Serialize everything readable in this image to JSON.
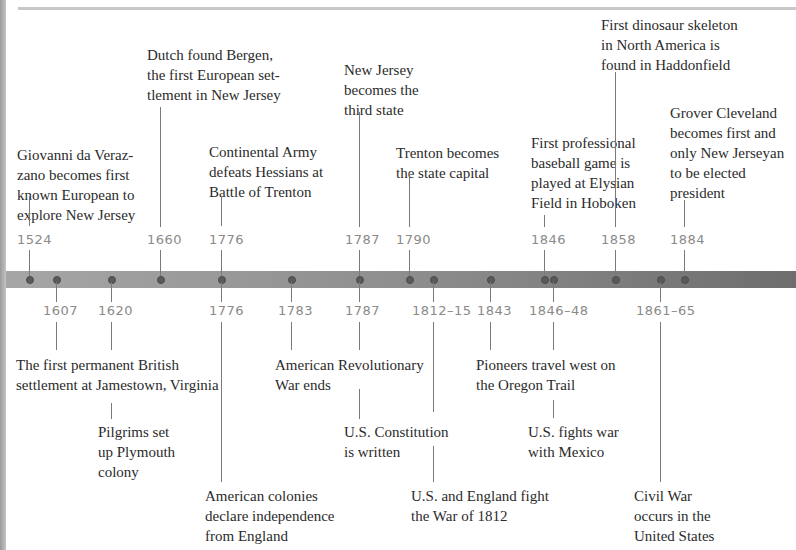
{
  "timeline": {
    "above_events": [
      {
        "year": "1524",
        "text": "Giovanni da Veraz-\nzano becomes first\nknown European to\nexplore New Jersey"
      },
      {
        "year": "1660",
        "text": "Dutch found Bergen,\nthe first European set-\ntlement in New Jersey"
      },
      {
        "year": "1776",
        "text": "Continental Army\ndefeats Hessians at\nBattle of Trenton"
      },
      {
        "year": "1787",
        "text": "New Jersey\nbecomes the\nthird state"
      },
      {
        "year": "1790",
        "text": "Trenton becomes\nthe state capital"
      },
      {
        "year": "1846",
        "text": "First professional\nbaseball game is\nplayed at Elysian\nField in Hoboken"
      },
      {
        "year": "1858",
        "text": "First dinosaur skeleton\nin North America is\nfound in Haddonfield"
      },
      {
        "year": "1884",
        "text": "Grover Cleveland\nbecomes first and\nonly New Jerseyan\nto be elected\npresident"
      }
    ],
    "below_events": [
      {
        "year": "1607",
        "text": "The first permanent British\nsettlement at Jamestown, Virginia"
      },
      {
        "year": "1620",
        "text": "Pilgrims set\nup Plymouth\ncolony"
      },
      {
        "year": "1776",
        "text": "American colonies\ndeclare independence\nfrom England"
      },
      {
        "year": "1783",
        "text": "American Revolutionary\nWar ends"
      },
      {
        "year": "1787",
        "text": "U.S. Constitution\nis written"
      },
      {
        "year": "1812–15",
        "text": "U.S. and England fight\nthe War of 1812"
      },
      {
        "year": "1843",
        "text": "Pioneers travel west on\nthe Oregon Trail"
      },
      {
        "year": "1846–48",
        "text": "U.S. fights war\nwith Mexico"
      },
      {
        "year": "1861–65",
        "text": "Civil War\noccurs in the\nUnited States"
      }
    ]
  },
  "colors": {
    "bar_light": "#a6a6a6",
    "bar_dark": "#6e6e6e",
    "year_text": "#8a8a8a",
    "label_text": "#2b2b2b"
  }
}
